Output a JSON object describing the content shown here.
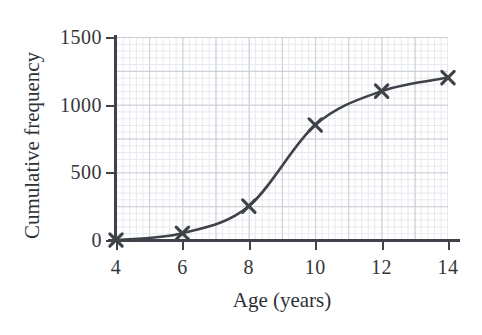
{
  "chart_data": {
    "type": "line",
    "title": "",
    "xlabel": "Age (years)",
    "ylabel": "Cumulative frequency",
    "x": [
      4,
      6,
      8,
      10,
      12,
      14
    ],
    "values": [
      0,
      50,
      250,
      850,
      1100,
      1200
    ],
    "series": [
      {
        "name": "Cumulative frequency",
        "values": [
          0,
          50,
          250,
          850,
          1100,
          1200
        ]
      }
    ],
    "xlim": [
      4,
      14
    ],
    "ylim": [
      0,
      1500
    ],
    "xticks": [
      "4",
      "6",
      "8",
      "10",
      "12",
      "14"
    ],
    "yticks": [
      "0",
      "500",
      "1000",
      "1500"
    ],
    "xtick_values": [
      4,
      6,
      8,
      10,
      12,
      14
    ],
    "ytick_values": [
      0,
      500,
      1000,
      1500
    ],
    "grid": true,
    "grid_minor": true,
    "legend": false,
    "marker": "x",
    "curve_style": "smooth-ogive",
    "colors": {
      "curve": "#3f4248",
      "marker": "#3f4248",
      "axis": "#3f4248",
      "grid_major": "#c9cdd4",
      "grid_minor": "#e6e9ee",
      "text": "#33363b",
      "background": "#ffffff"
    }
  },
  "axis": {
    "x_title": "Age (years)",
    "y_title": "Cumulative frequency",
    "x_tick_labels": [
      "4",
      "6",
      "8",
      "10",
      "12",
      "14"
    ],
    "y_tick_labels": [
      "0",
      "500",
      "1000",
      "1500"
    ]
  }
}
